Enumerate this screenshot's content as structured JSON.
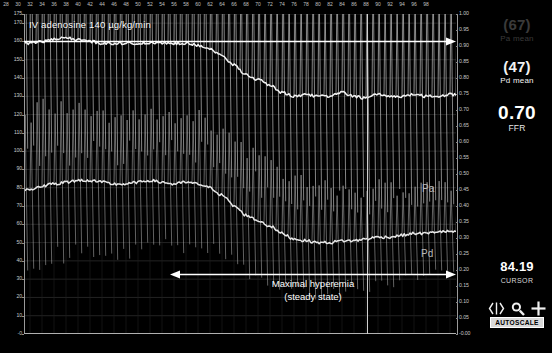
{
  "annotations": {
    "drug_label": "IV adenosine 140 µg/kg/min",
    "hyperemia_line1": "Maximal hyperemia",
    "hyperemia_line2": "(steady state)",
    "tag_pa": "Pa",
    "tag_pd": "Pd"
  },
  "panel": {
    "pa_value": "(67)",
    "pa_label": "Pa mean",
    "pd_value": "(47)",
    "pd_label": "Pd mean",
    "ffr_value": "0.70",
    "ffr_label": "FFR",
    "cursor_value": "84.19",
    "cursor_label": "CURSOR",
    "autoscale_label": "AUTOSCALE",
    "icons": [
      "calipers-icon",
      "magnifier-icon",
      "crosshair-icon"
    ]
  },
  "colors": {
    "background": "#000000",
    "trace": "#f2f2f2",
    "grid": "#323232",
    "axis_text": "#c8c8c8",
    "cursor": "#cfcfcf",
    "button_bg": "#d9d9d9"
  },
  "chart_data": {
    "type": "line",
    "title": "IV adenosine 140 µg/kg/min",
    "xlabel": "",
    "ylabel": "Pressure (mmHg)",
    "ylim": [
      0,
      175
    ],
    "xlim": [
      27,
      99
    ],
    "y2lim": [
      0.0,
      1.0
    ],
    "y2label": "FFR",
    "grid": true,
    "legend": [
      "Pa",
      "Pd"
    ],
    "yticks": [
      175,
      170,
      160,
      150,
      140,
      130,
      120,
      110,
      100,
      90,
      80,
      70,
      60,
      50,
      40,
      30,
      20,
      10,
      0
    ],
    "ytick_labels": [
      "175",
      "170",
      "160",
      "150",
      "140",
      "130",
      "120",
      "110",
      "100",
      "90",
      "80",
      "70",
      "60",
      "50",
      "40",
      "30",
      "20",
      "10",
      "-0"
    ],
    "y2ticks": [
      1.0,
      0.95,
      0.9,
      0.85,
      0.8,
      0.75,
      0.7,
      0.65,
      0.6,
      0.55,
      0.5,
      0.45,
      0.4,
      0.35,
      0.3,
      0.25,
      0.2,
      0.15,
      0.1,
      0.05,
      0.0
    ],
    "y2tick_labels": [
      "1.00",
      "0.95",
      "0.90",
      "0.85",
      "0.80",
      "0.75",
      "0.70",
      "0.65",
      "0.60",
      "0.55",
      "0.50",
      "0.45",
      "0.40",
      "0.35",
      "0.30",
      "0.25",
      "0.20",
      "0.15",
      "0.10",
      "0.05",
      "-0.00"
    ],
    "xticks": [
      28,
      30,
      32,
      34,
      36,
      38,
      40,
      42,
      44,
      46,
      48,
      50,
      52,
      54,
      56,
      58,
      60,
      62,
      64,
      66,
      68,
      70,
      72,
      74,
      76,
      78,
      80,
      82,
      84,
      86,
      88,
      90,
      92,
      94,
      96,
      98
    ],
    "cursor_x": 84.19,
    "annotations": [
      {
        "text": "IV adenosine 140 µg/kg/min",
        "x_start": 28,
        "x_end": 98,
        "kind": "arrow-right",
        "y_mmHg": 168
      },
      {
        "text": "Maximal hyperemia (steady state)",
        "x_start": 53,
        "x_end": 98,
        "kind": "arrow-both",
        "y_mmHg": 33
      }
    ],
    "series": [
      {
        "name": "Pa mean",
        "role": "aortic-mean-trend",
        "color": "#f2f2f2",
        "x": [
          28,
          30,
          32,
          34,
          36,
          38,
          40,
          42,
          44,
          46,
          48,
          50,
          52,
          54,
          56,
          58,
          60,
          62,
          64,
          66,
          68,
          70,
          72,
          74,
          76,
          78,
          80,
          82,
          84,
          86,
          88,
          90,
          92,
          94,
          96,
          98
        ],
        "values": [
          159,
          160,
          161,
          162,
          161,
          160,
          159,
          159,
          159,
          159,
          159,
          159,
          159,
          159,
          158,
          156,
          152,
          147,
          142,
          139,
          136,
          132,
          130,
          131,
          130,
          130,
          132,
          130,
          129,
          131,
          130,
          130,
          131,
          130,
          130,
          131
        ]
      },
      {
        "name": "Pd mean",
        "role": "distal-mean-trend",
        "color": "#e8e8e8",
        "x": [
          28,
          30,
          32,
          34,
          36,
          38,
          40,
          42,
          44,
          46,
          48,
          50,
          52,
          54,
          56,
          58,
          60,
          62,
          64,
          66,
          68,
          70,
          72,
          74,
          76,
          78,
          80,
          82,
          84,
          86,
          88,
          90,
          92,
          94,
          96,
          98
        ],
        "values": [
          79,
          81,
          82,
          83,
          84,
          84,
          83,
          82,
          82,
          83,
          84,
          83,
          82,
          83,
          82,
          80,
          76,
          70,
          65,
          62,
          59,
          55,
          52,
          51,
          50,
          50,
          51,
          51,
          52,
          53,
          53,
          54,
          55,
          55,
          56,
          56
        ]
      },
      {
        "name": "Pa phasic",
        "role": "aortic-pressure-waveform",
        "color": "#d0d0d0",
        "systolic_start": 130,
        "systolic_end": 122,
        "diastolic_start": 22,
        "diastolic_end": 26,
        "beats": 72
      },
      {
        "name": "Pd phasic",
        "role": "distal-pressure-waveform",
        "color": "#b8b8b8",
        "systolic_start": 90,
        "systolic_end": 62,
        "diastolic_start": 20,
        "diastolic_end": 24,
        "beats": 72
      }
    ]
  }
}
